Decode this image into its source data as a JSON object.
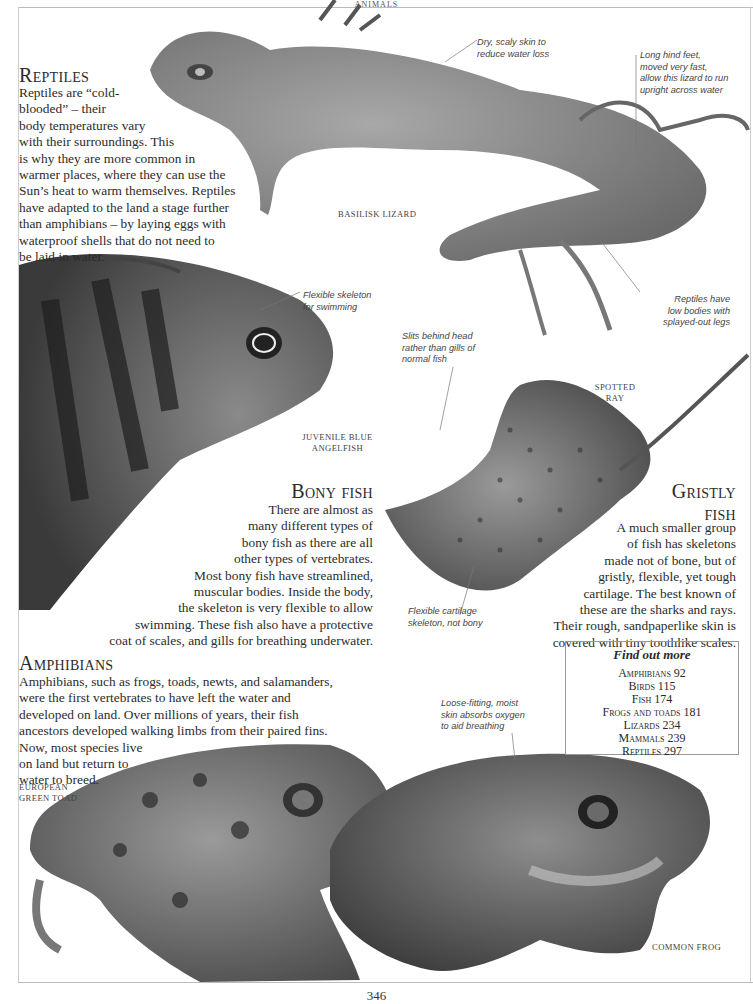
{
  "running_head": "ANIMALS",
  "page_number": "346",
  "reptiles": {
    "heading": "Reptiles",
    "lines": [
      "Reptiles are “cold-",
      "blooded” – their",
      "body temperatures vary",
      "with their surroundings. This",
      "is why they are more common in",
      "warmer places, where they can use the",
      "Sun’s heat to warm themselves. Reptiles",
      "have adapted to the land a stage further",
      "than amphibians – by laying eggs with",
      "waterproof shells that do not need to",
      "be laid in water."
    ],
    "specimen_label": "BASILISK LIZARD",
    "captions": {
      "skin": [
        "Dry, scaly skin to",
        "reduce water loss"
      ],
      "feet": [
        "Long hind feet,",
        "moved very fast,",
        "allow this lizard to run",
        "upright across water"
      ],
      "legs": [
        "Reptiles have",
        "low bodies with",
        "splayed-out legs"
      ]
    }
  },
  "bony_fish": {
    "heading": "Bony fish",
    "lines": [
      "There are almost as",
      "many different types of",
      "bony fish as there are all",
      "other types of vertebrates.",
      "Most bony fish have streamlined,",
      "muscular bodies. Inside the body,",
      "the skeleton is very flexible to allow",
      "swimming. These fish also have a protective",
      "coat of scales, and gills for breathing underwater."
    ],
    "specimen_label": [
      "JUVENILE BLUE",
      "ANGELFISH"
    ],
    "caption": [
      "Flexible skeleton",
      "for swimming"
    ]
  },
  "gristly_fish": {
    "heading": [
      "Gristly",
      "fish"
    ],
    "lines": [
      "A much smaller group",
      "of fish has skeletons",
      "made not of bone, but of",
      "gristly, flexible, yet tough",
      "cartilage. The best known of",
      "these are the sharks and rays.",
      "Their rough, sandpaperlike skin is",
      "covered with tiny toothlike scales."
    ],
    "specimen_label": [
      "SPOTTED",
      "RAY"
    ],
    "captions": {
      "slits": [
        "Slits behind head",
        "rather than gills of",
        "normal fish"
      ],
      "cartilage": [
        "Flexible cartilage",
        "skeleton, not bony"
      ]
    }
  },
  "amphibians": {
    "heading": "Amphibians",
    "lines": [
      "Amphibians, such as frogs, toads, newts, and salamanders,",
      "were the first vertebrates to have left the water and",
      "developed on land. Over millions of years, their fish",
      "ancestors developed walking limbs from their paired fins.",
      "Now, most species live",
      "on land but return to",
      "water to breed."
    ],
    "specimen_labels": {
      "toad": [
        "EUROPEAN",
        "GREEN TOAD"
      ],
      "frog": "COMMON FROG"
    },
    "caption": [
      "Loose-fitting, moist",
      "skin absorbs oxygen",
      "to aid breathing"
    ]
  },
  "find_out_more": {
    "title": "Find out more",
    "items": [
      "Amphibians  92",
      "Birds  115",
      "Fish  174",
      "Frogs and toads  181",
      "Lizards  234",
      "Mammals  239",
      "Reptiles  297"
    ]
  },
  "colors": {
    "text": "#2b2b2b",
    "rule": "#bbbbbb",
    "photo_dark": "#3a3a3a",
    "photo_mid": "#7a7a7a",
    "photo_light": "#b5b5b5"
  }
}
